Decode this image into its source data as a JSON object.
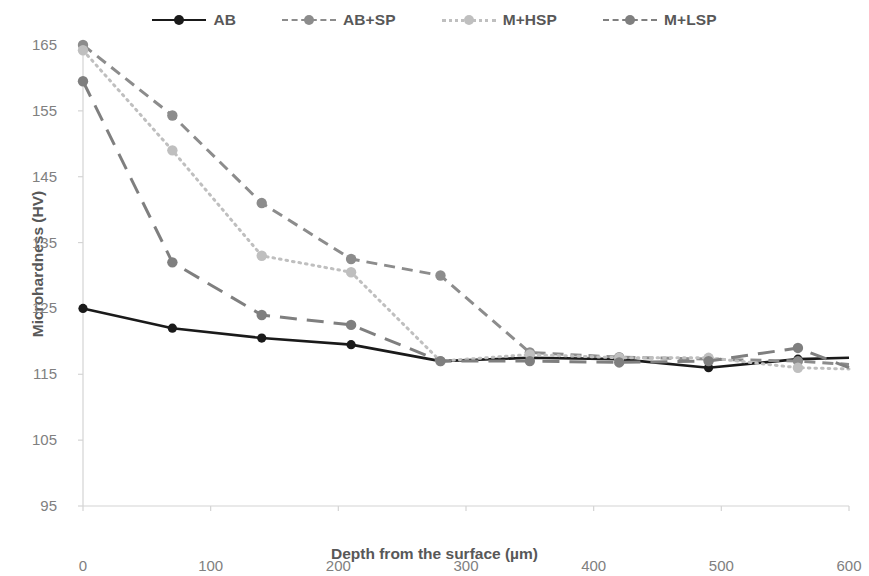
{
  "chart_data": {
    "type": "line",
    "title": "",
    "xlabel": "Depth from the surface (µm)",
    "ylabel": "Microhardness (HV)",
    "xlim": [
      0,
      600
    ],
    "ylim": [
      95,
      165
    ],
    "xticks": [
      0,
      100,
      200,
      300,
      400,
      500,
      600
    ],
    "yticks": [
      95,
      105,
      115,
      125,
      135,
      145,
      155,
      165
    ],
    "grid": false,
    "legend_position": "top-center",
    "x": [
      0,
      70,
      140,
      210,
      280,
      350,
      420,
      490,
      560,
      600
    ],
    "series": [
      {
        "name": "AB",
        "color": "#1a1a1a",
        "line_style": "solid",
        "marker": "circle",
        "values": [
          125.0,
          122.0,
          120.5,
          119.5,
          117.0,
          117.5,
          117.3,
          116.0,
          117.3,
          117.5
        ]
      },
      {
        "name": "AB+SP",
        "color": "#8c8c8c",
        "line_style": "dashed",
        "marker": "circle",
        "values": [
          165.0,
          154.3,
          141.0,
          132.5,
          130.0,
          118.3,
          117.6,
          117.3,
          117.0,
          116.5
        ]
      },
      {
        "name": "M+HSP",
        "color": "#bfbfbf",
        "line_style": "dotted",
        "marker": "circle",
        "values": [
          164.2,
          149.0,
          133.0,
          130.5,
          117.0,
          118.0,
          117.5,
          117.5,
          116.0,
          115.8
        ]
      },
      {
        "name": "M+LSP",
        "color": "#7f7f7f",
        "line_style": "long-dash",
        "marker": "circle",
        "values": [
          159.5,
          132.0,
          124.0,
          122.5,
          117.0,
          117.0,
          116.8,
          117.0,
          119.0,
          116.0
        ]
      }
    ]
  },
  "legend": {
    "items": [
      {
        "label": "AB",
        "swatch": "solid-line-with-dot-marker"
      },
      {
        "label": "AB+SP",
        "swatch": "dashed-line-with-dot-marker"
      },
      {
        "label": "M+HSP",
        "swatch": "dotted-line-with-dot-marker"
      },
      {
        "label": "M+LSP",
        "swatch": "long-dashed-line-with-dot-marker"
      }
    ]
  },
  "axes": {
    "x_title": "Depth from the surface (µm)",
    "y_title": "Microhardness (HV)"
  },
  "colors": {
    "ab": "#1a1a1a",
    "ab_sp": "#8c8c8c",
    "m_hsp": "#bfbfbf",
    "m_lsp": "#7f7f7f",
    "axis": "#d4d4d4",
    "tick_text": "#808080"
  }
}
